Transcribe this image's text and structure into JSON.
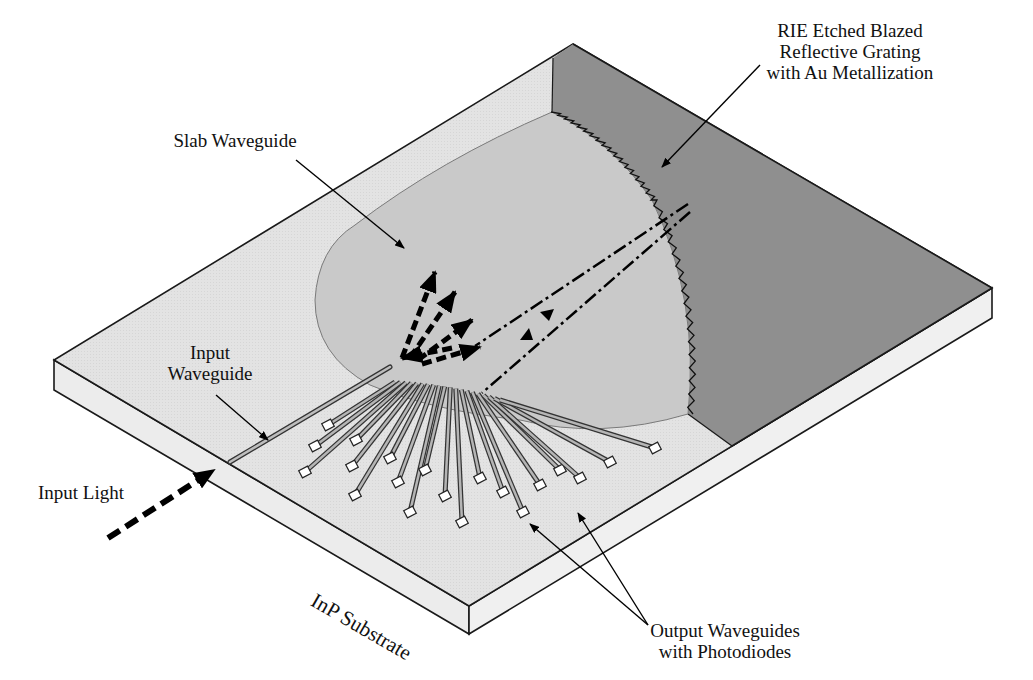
{
  "figure": {
    "type": "isometric device schematic"
  },
  "labels": {
    "grating": [
      "RIE Etched Blazed",
      "Reflective Grating",
      "with Au Metallization"
    ],
    "slab_waveguide": "Slab Waveguide",
    "input_waveguide": [
      "Input",
      "Waveguide"
    ],
    "input_light": "Input Light",
    "substrate": "InP Substrate",
    "output_waveguides": [
      "Output Waveguides",
      "with Photodiodes"
    ]
  },
  "colors": {
    "substrate_top": "#e3e3e3",
    "substrate_side": "#ececec",
    "slab_region": "#c9c9c9",
    "etched_region": "#8f8f8f",
    "outline": "#1a1a1a",
    "arrow": "#000000",
    "pad": "#ffffff"
  },
  "output_waveguide_count": 20
}
